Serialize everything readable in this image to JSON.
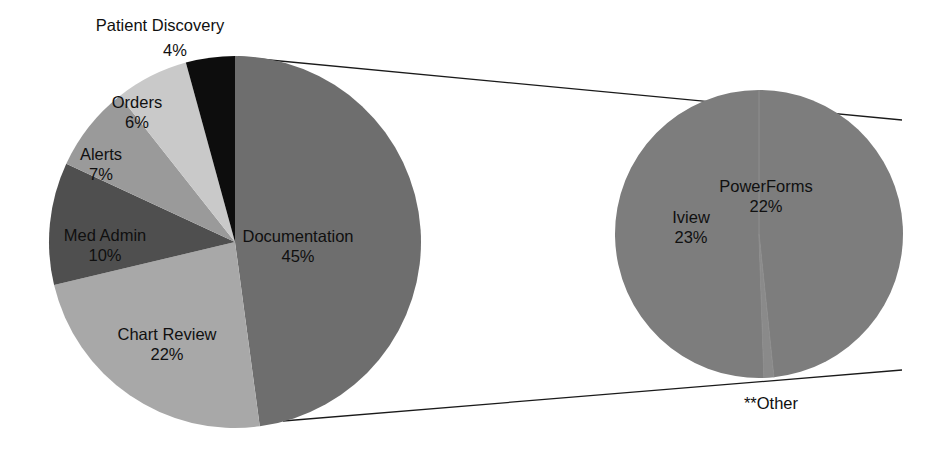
{
  "figure": {
    "background_color": "#ffffff",
    "width": 934,
    "height": 453
  },
  "chart_data": {
    "type": "pie",
    "title": "",
    "subtitle": "",
    "xlabel": "",
    "ylabel": "",
    "legend_position": "none",
    "grid": false,
    "layout": "two pies: main pie at left, exploded detail pie at right connected by two leader lines from the Documentation slice",
    "charts": [
      {
        "name": "main-pie",
        "type": "pie",
        "start_angle_deg": 0,
        "direction": "clockwise",
        "center": {
          "x": 235,
          "y": 242
        },
        "radius": 186,
        "categories": [
          "Documentation",
          "Chart Review",
          "Med Admin",
          "Alerts",
          "Orders",
          "Patient Discovery"
        ],
        "values": [
          45,
          22,
          10,
          7,
          6,
          4
        ],
        "unit": "%",
        "slices": [
          {
            "label": "Documentation",
            "value": 45,
            "value_text": "45%",
            "color": "#6e6e6e",
            "label_x": 298,
            "label_y": 238,
            "pct_x": 298,
            "pct_y": 258,
            "label_inside": true
          },
          {
            "label": "Chart Review",
            "value": 22,
            "value_text": "22%",
            "color": "#a8a8a8",
            "label_x": 167,
            "label_y": 336,
            "pct_x": 167,
            "pct_y": 356,
            "label_inside": true
          },
          {
            "label": "Med Admin",
            "value": 10,
            "value_text": "10%",
            "color": "#4f4f4f",
            "label_x": 105,
            "label_y": 237,
            "pct_x": 105,
            "pct_y": 257,
            "label_inside": true
          },
          {
            "label": "Alerts",
            "value": 7,
            "value_text": "7%",
            "color": "#9a9a9a",
            "label_x": 101,
            "label_y": 156,
            "pct_x": 101,
            "pct_y": 176,
            "label_inside": true
          },
          {
            "label": "Orders",
            "value": 6,
            "value_text": "6%",
            "color": "#c9c9c9",
            "label_x": 137,
            "label_y": 104,
            "pct_x": 137,
            "pct_y": 124,
            "label_inside": true
          },
          {
            "label": "Patient Discovery",
            "value": 4,
            "value_text": "4%",
            "color": "#0d0d0d",
            "label_x": 160,
            "label_y": 27,
            "pct_x": 175,
            "pct_y": 52,
            "label_inside": false
          }
        ]
      },
      {
        "name": "detail-pie",
        "type": "pie",
        "start_angle_deg": 0,
        "direction": "clockwise",
        "center": {
          "x": 759,
          "y": 234
        },
        "radius": 144,
        "categories": [
          "PowerForms",
          "**Other",
          "Iview"
        ],
        "values": [
          22,
          0.5,
          23
        ],
        "unit": "%",
        "slices": [
          {
            "label": "PowerForms",
            "value": 22,
            "value_text": "22%",
            "color": "#7d7d7d",
            "label_x": 766,
            "label_y": 188,
            "pct_x": 766,
            "pct_y": 208,
            "label_inside": true
          },
          {
            "label": "**Other",
            "value": 0.5,
            "value_text": "",
            "color": "#8a8a8a",
            "label_x": 771,
            "label_y": 405,
            "pct_x": null,
            "pct_y": null,
            "label_inside": false
          },
          {
            "label": "Iview",
            "value": 23,
            "value_text": "23%",
            "color": "#7d7d7d",
            "label_x": 691,
            "label_y": 219,
            "pct_x": 691,
            "pct_y": 239,
            "label_inside": true
          }
        ]
      }
    ],
    "leader_lines": [
      {
        "name": "upper-connector",
        "x1": 238,
        "y1": 57,
        "x2": 902,
        "y2": 120
      },
      {
        "name": "lower-connector",
        "x1": 283,
        "y1": 421,
        "x2": 902,
        "y2": 370
      }
    ],
    "annotations": [
      {
        "text": "**Other",
        "x": 771,
        "y": 405
      }
    ]
  }
}
